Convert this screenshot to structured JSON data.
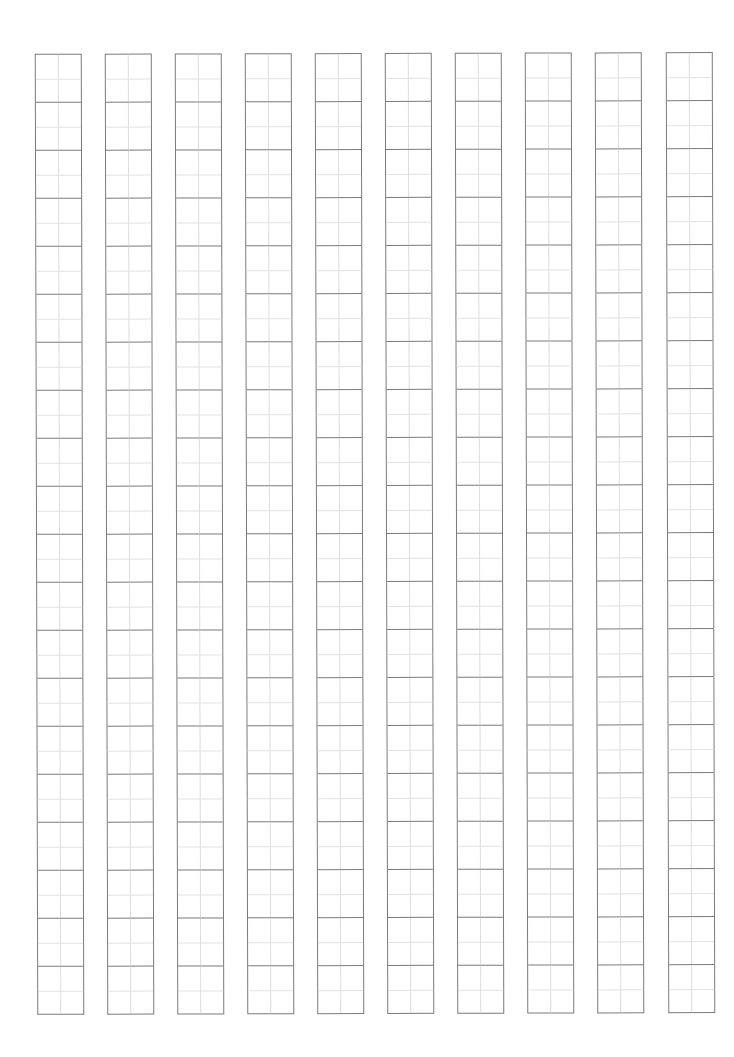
{
  "page": {
    "type": "character-practice-sheet",
    "background_color": "#ffffff"
  },
  "grid": {
    "style": "tian-zi-ge",
    "columns": 10,
    "rows_per_column": 20,
    "column_left_positions": [
      36,
      106,
      176,
      246,
      316,
      386,
      456,
      526,
      596,
      667
    ],
    "column_width": 47,
    "top": 53,
    "cell_height": 48,
    "border_color": "#7a7a7a",
    "guide_line_color": "#dcdcdc",
    "cells_filled": 0
  }
}
